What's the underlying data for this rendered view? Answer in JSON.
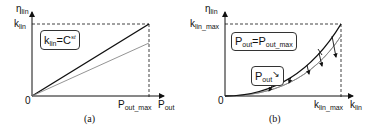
{
  "panel_a": {
    "caption": "(a)",
    "y_axis": {
      "symbol": "η",
      "sub": "lin"
    },
    "x_axis": {
      "symbol": "P",
      "sub": "out"
    },
    "origin": "0",
    "y_tick": {
      "symbol": "k",
      "sub": "lin"
    },
    "x_tick": {
      "symbol": "P",
      "sub": "out_max"
    },
    "box": {
      "lhs": "k",
      "lhs_sub": "lin",
      "eq": "=C",
      "sup": "st"
    },
    "curves": [
      {
        "name": "black-line",
        "shape": "linear",
        "color": "#111111"
      },
      {
        "name": "gray-line",
        "shape": "linear",
        "color": "#888888"
      }
    ]
  },
  "panel_b": {
    "caption": "(b)",
    "y_axis": {
      "symbol": "η",
      "sub": "lin"
    },
    "x_axis": {
      "symbol": "k",
      "sub": "lin"
    },
    "origin": "0",
    "y_tick": {
      "symbol": "k",
      "sub": "lin_max"
    },
    "x_tick": {
      "symbol": "k",
      "sub": "lin_max"
    },
    "box1": {
      "lhs": "P",
      "lhs_sub": "out",
      "eq": "=P",
      "rhs_sub": "out_max"
    },
    "box2": {
      "lhs": "P",
      "lhs_sub": "out",
      "arrow": "↘"
    },
    "curves": [
      {
        "name": "black-curve",
        "shape": "convex",
        "color": "#111111"
      },
      {
        "name": "gray-curve",
        "shape": "convex",
        "color": "#888888"
      }
    ]
  }
}
